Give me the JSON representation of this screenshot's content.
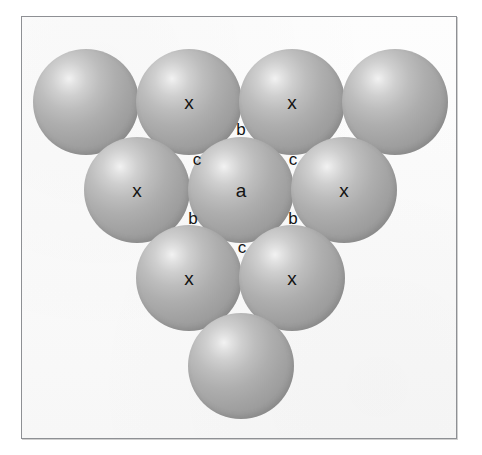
{
  "figure": {
    "caption": "",
    "background_color": "#ffffff",
    "panel_background_color": "#fbfbfb",
    "panel_border_color": "#8e9094",
    "sphere_base_color": "#a3a3a3",
    "sphere_highlight_color": "#f2f2f2",
    "sphere_shadow_color": "#8b8b8b",
    "label_color": "#141414"
  },
  "spheres": [
    {
      "id": "r1c1",
      "label": "",
      "row": 1,
      "col": 1,
      "cx": 85,
      "cy": 101,
      "r": 53
    },
    {
      "id": "r1c2",
      "label": "x",
      "row": 1,
      "col": 2,
      "cx": 188,
      "cy": 101,
      "r": 53
    },
    {
      "id": "r1c3",
      "label": "x",
      "row": 1,
      "col": 3,
      "cx": 291,
      "cy": 101,
      "r": 53
    },
    {
      "id": "r1c4",
      "label": "",
      "row": 1,
      "col": 4,
      "cx": 394,
      "cy": 101,
      "r": 53
    },
    {
      "id": "r2c1",
      "label": "x",
      "row": 2,
      "col": 1,
      "cx": 136,
      "cy": 189,
      "r": 53
    },
    {
      "id": "r2c2",
      "label": "a",
      "row": 2,
      "col": 2,
      "cx": 240,
      "cy": 189,
      "r": 53
    },
    {
      "id": "r2c3",
      "label": "x",
      "row": 2,
      "col": 3,
      "cx": 343,
      "cy": 189,
      "r": 53
    },
    {
      "id": "r3c1",
      "label": "x",
      "row": 3,
      "col": 1,
      "cx": 188,
      "cy": 277,
      "r": 53
    },
    {
      "id": "r3c2",
      "label": "x",
      "row": 3,
      "col": 2,
      "cx": 291,
      "cy": 277,
      "r": 53
    },
    {
      "id": "r4c1",
      "label": "",
      "row": 4,
      "col": 1,
      "cx": 240,
      "cy": 365,
      "r": 53
    }
  ],
  "interstitial_labels": [
    {
      "id": "gap-top",
      "text": "b",
      "x": 240,
      "y": 128
    },
    {
      "id": "gap-upper-left",
      "text": "c",
      "x": 196,
      "y": 158
    },
    {
      "id": "gap-upper-right",
      "text": "c",
      "x": 292,
      "y": 158
    },
    {
      "id": "gap-lower-left",
      "text": "b",
      "x": 192,
      "y": 217
    },
    {
      "id": "gap-lower-right",
      "text": "b",
      "x": 292,
      "y": 217
    },
    {
      "id": "gap-bottom",
      "text": "c",
      "x": 241,
      "y": 246
    }
  ],
  "legend": {
    "a": "a",
    "b": "b",
    "c": "c",
    "x": "x"
  }
}
